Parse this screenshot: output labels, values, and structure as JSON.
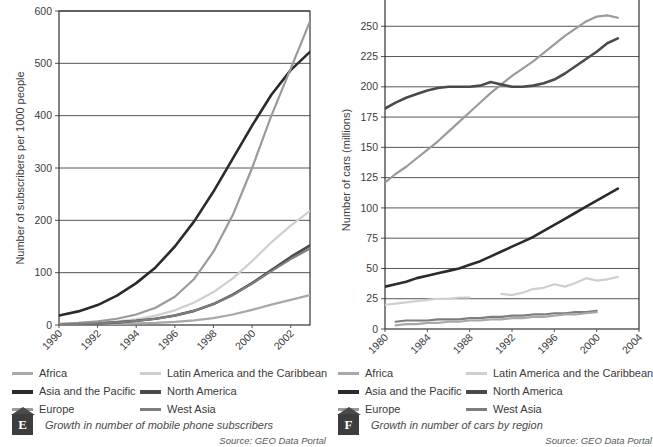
{
  "figures": [
    {
      "id": "E",
      "badge_letter": "E",
      "caption": "Growth in number of mobile phone subscribers",
      "source": "Source: GEO Data Portal",
      "legend": [
        {
          "label": "Africa",
          "color": "#a8a8a8"
        },
        {
          "label": "Latin America and the Caribbean",
          "color": "#cfcfcf"
        },
        {
          "label": "Asia and the Pacific",
          "color": "#2b2b2b"
        },
        {
          "label": "North America",
          "color": "#4a4a4a"
        },
        {
          "label": "Europe",
          "color": "#9a9a9a"
        },
        {
          "label": "West Asia",
          "color": "#7d7d7d"
        }
      ],
      "chart_data": {
        "type": "line",
        "title": "Growth in number of mobile phone subscribers",
        "xlabel": "",
        "ylabel": "Number of subscribers per 1000 people",
        "xlim": [
          1990,
          2003
        ],
        "ylim": [
          0,
          600
        ],
        "grid": true,
        "legend_position": "below",
        "xticks": [
          1990,
          1992,
          1994,
          1996,
          1998,
          2000,
          2002
        ],
        "yticks": [
          0,
          100,
          200,
          300,
          400,
          500,
          600
        ],
        "x": [
          1990,
          1991,
          1992,
          1993,
          1994,
          1995,
          1996,
          1997,
          1998,
          1999,
          2000,
          2001,
          2002,
          2003
        ],
        "series": [
          {
            "name": "Africa",
            "color": "#a8a8a8",
            "values": [
              0,
              1,
              1,
              2,
              3,
              4,
              6,
              9,
              13,
              20,
              29,
              39,
              48,
              57
            ]
          },
          {
            "name": "Latin America and the Caribbean",
            "color": "#cfcfcf",
            "values": [
              1,
              2,
              4,
              7,
              11,
              18,
              28,
              43,
              63,
              89,
              122,
              158,
              190,
              218
            ]
          },
          {
            "name": "Asia and the Pacific",
            "color": "#2b2b2b",
            "values": [
              18,
              26,
              38,
              56,
              80,
              110,
              150,
              198,
              255,
              318,
              381,
              440,
              487,
              522
            ]
          },
          {
            "name": "North America",
            "color": "#4a4a4a",
            "values": [
              1,
              2,
              3,
              5,
              8,
              12,
              18,
              27,
              40,
              58,
              80,
              105,
              130,
              152
            ]
          },
          {
            "name": "Europe",
            "color": "#9a9a9a",
            "values": [
              2,
              4,
              7,
              12,
              20,
              33,
              54,
              88,
              140,
              210,
              300,
              400,
              490,
              580
            ]
          },
          {
            "name": "West Asia",
            "color": "#7d7d7d",
            "values": [
              1,
              2,
              3,
              5,
              8,
              12,
              18,
              27,
              40,
              57,
              79,
              103,
              126,
              146
            ]
          }
        ]
      }
    },
    {
      "id": "F",
      "badge_letter": "F",
      "caption": "Growth in number of cars by region",
      "source": "Source: GEO Data Portal",
      "legend": [
        {
          "label": "Africa",
          "color": "#a8a8a8"
        },
        {
          "label": "Latin America and the Caribbean",
          "color": "#cfcfcf"
        },
        {
          "label": "Asia and the Pacific",
          "color": "#2b2b2b"
        },
        {
          "label": "North America",
          "color": "#4a4a4a"
        },
        {
          "label": "Europe",
          "color": "#9a9a9a"
        },
        {
          "label": "West Asia",
          "color": "#7d7d7d"
        }
      ],
      "chart_data": {
        "type": "line",
        "title": "Growth in number of cars by region",
        "xlabel": "",
        "ylabel": "Number of cars (millions)",
        "xlim": [
          1980,
          2004
        ],
        "ylim": [
          0,
          275
        ],
        "grid": true,
        "legend_position": "below",
        "xticks": [
          1980,
          1984,
          1988,
          1992,
          1996,
          2000,
          2004
        ],
        "yticks": [
          0,
          25,
          50,
          75,
          100,
          125,
          150,
          175,
          200,
          225,
          250,
          275
        ],
        "x": [
          1980,
          1981,
          1982,
          1983,
          1984,
          1985,
          1986,
          1987,
          1988,
          1989,
          1990,
          1991,
          1992,
          1993,
          1994,
          1995,
          1996,
          1997,
          1998,
          1999,
          2000,
          2001,
          2002
        ],
        "series": [
          {
            "name": "Europe",
            "color": "#9a9a9a",
            "values": [
              121,
              128,
              134,
              141,
              148,
              155,
              163,
              171,
              179,
              187,
              195,
              202,
              209,
              215,
              221,
              228,
              235,
              242,
              248,
              254,
              258,
              259,
              257
            ]
          },
          {
            "name": "North America",
            "color": "#4a4a4a",
            "values": [
              182,
              187,
              191,
              194,
              197,
              199,
              200,
              200,
              200,
              201,
              204,
              202,
              200,
              200,
              201,
              203,
              206,
              211,
              217,
              223,
              229,
              236,
              240
            ]
          },
          {
            "name": "Asia and the Pacific",
            "color": "#2b2b2b",
            "values": [
              35,
              37,
              39,
              42,
              44,
              46,
              48,
              50,
              53,
              56,
              60,
              64,
              68,
              72,
              76,
              81,
              86,
              91,
              96,
              101,
              106,
              111,
              116
            ]
          },
          {
            "name": "Latin America and the Caribbean",
            "color": "#cfcfcf",
            "values": [
              20,
              21,
              22,
              23,
              24,
              25,
              25,
              26,
              26,
              null,
              null,
              29,
              28,
              30,
              33,
              34,
              37,
              35,
              38,
              42,
              40,
              41,
              43
            ]
          },
          {
            "name": "West Asia",
            "color": "#7d7d7d",
            "values": [
              null,
              6,
              7,
              7,
              7,
              8,
              8,
              8,
              9,
              9,
              10,
              10,
              11,
              11,
              12,
              12,
              13,
              13,
              14,
              14,
              15,
              null,
              null
            ]
          },
          {
            "name": "Africa",
            "color": "#a8a8a8",
            "values": [
              null,
              3,
              4,
              4,
              5,
              5,
              6,
              6,
              7,
              7,
              8,
              8,
              9,
              9,
              10,
              10,
              11,
              12,
              12,
              13,
              14,
              null,
              null
            ]
          }
        ]
      }
    }
  ]
}
